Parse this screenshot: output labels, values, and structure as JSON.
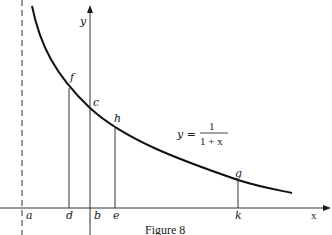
{
  "figure": {
    "caption": "Figure 8",
    "axes": {
      "x_label": "x",
      "y_label": "y"
    },
    "equation": {
      "lhs": "y =",
      "numerator": "1",
      "denominator": "1 + x"
    },
    "curve_points": {
      "f": "f",
      "c": "c",
      "h": "h",
      "g": "g"
    },
    "x_axis_points": {
      "a": "a",
      "d": "d",
      "b": "b",
      "e": "e",
      "k": "k"
    },
    "colors": {
      "ink": "#1a1a1a",
      "background": "#ffffff"
    }
  }
}
